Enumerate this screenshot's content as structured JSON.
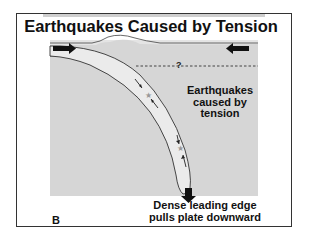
{
  "figure": {
    "title": "Earthquakes Caused by Tension",
    "panel_label": "B",
    "copyright_line": "illegible copyright notice",
    "annotations": {
      "earthquakes_label": [
        "Earthquakes",
        "caused by",
        "tension"
      ],
      "question_mark": "?",
      "bottom_label": [
        "Dense leading edge",
        "pulls plate downward"
      ]
    },
    "icons": [
      "right-arrow-icon",
      "left-arrow-icon",
      "down-arrow-icon",
      "star-icon"
    ],
    "colors": {
      "background_panel": "#d6d6d6",
      "slab_fill": "#ebebeb",
      "arrows": "#111111",
      "star": "#999999"
    }
  }
}
